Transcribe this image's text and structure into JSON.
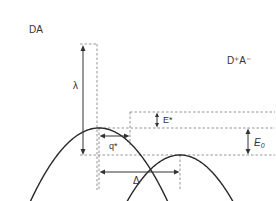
{
  "diagram": {
    "type": "marcus-parabolas",
    "curves": [
      {
        "id": "reactant",
        "label": "DA"
      },
      {
        "id": "product",
        "label": "D⁺A⁻"
      }
    ],
    "labels": {
      "reorganization_energy": "λ",
      "activation_energy": "E*",
      "transition_coordinate": "q*",
      "driving_force": "E",
      "driving_force_sub": "0",
      "displacement": "Δ"
    }
  }
}
